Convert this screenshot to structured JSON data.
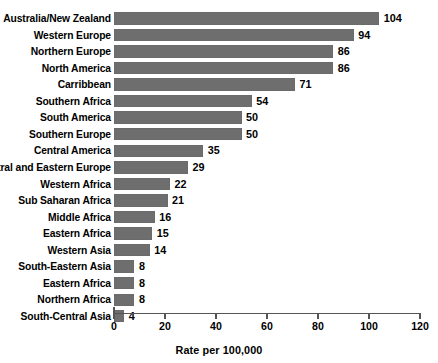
{
  "chart_data": {
    "type": "bar",
    "orientation": "horizontal",
    "title": "",
    "xlabel": "Rate per 100,000",
    "ylabel": "",
    "xlim": [
      0,
      120
    ],
    "xticks": [
      0,
      20,
      40,
      60,
      80,
      100,
      120
    ],
    "grid": false,
    "legend": null,
    "bar_color": "#6e6e6e",
    "categories": [
      "Australia/New Zealand",
      "Western Europe",
      "Northern Europe",
      "North America",
      "Carribbean",
      "Southern Africa",
      "South America",
      "Southern Europe",
      "Central America",
      "Central and Eastern Europe",
      "Western Africa",
      "Sub Saharan Africa",
      "Middle Africa",
      "Eastern Africa",
      "Western Asia",
      "South-Eastern Asia",
      "Eastern Africa",
      "Northern Africa",
      "South-Central Asia"
    ],
    "values": [
      104,
      94,
      86,
      86,
      71,
      54,
      50,
      50,
      35,
      29,
      22,
      21,
      16,
      15,
      14,
      8,
      8,
      8,
      4
    ],
    "value_labels": [
      "104",
      "94",
      "86",
      "86",
      "71",
      "54",
      "50",
      "50",
      "35",
      "29",
      "22",
      "21",
      "16",
      "15",
      "14",
      "8",
      "8",
      "8",
      "4"
    ],
    "tick_labels": [
      "0",
      "20",
      "40",
      "60",
      "80",
      "100",
      "120"
    ]
  }
}
